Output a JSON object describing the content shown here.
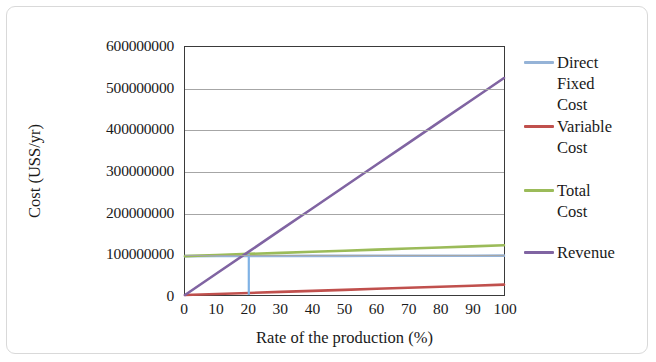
{
  "chart_data": {
    "type": "line",
    "title": "",
    "xlabel": "Rate of the production  (%)",
    "ylabel": "Cost (USS/yr)",
    "xlim": [
      0,
      100
    ],
    "ylim": [
      0,
      600000000
    ],
    "xticks": [
      "0",
      "10",
      "20",
      "30",
      "40",
      "50",
      "60",
      "70",
      "80",
      "90",
      "100"
    ],
    "yticks": [
      "0",
      "100000000",
      "200000000",
      "300000000",
      "400000000",
      "500000000",
      "600000000"
    ],
    "grid": "horizontal",
    "legend_position": "right",
    "x": [
      0,
      10,
      20,
      30,
      40,
      50,
      60,
      70,
      80,
      90,
      100
    ],
    "series": [
      {
        "name": "Direct Fixed Cost",
        "color": "#95B3D7",
        "values": [
          94000000,
          94200000,
          94400000,
          94500000,
          94600000,
          94700000,
          94800000,
          94900000,
          95000000,
          95100000,
          95200000
        ]
      },
      {
        "name": "Variable Cost",
        "color": "#C0504D",
        "values": [
          0,
          2500000,
          5000000,
          7500000,
          10000000,
          12500000,
          15000000,
          17500000,
          20000000,
          22500000,
          25000000
        ]
      },
      {
        "name": "Total Cost",
        "color": "#9BBB59",
        "values": [
          94000000,
          96700000,
          99400000,
          102000000,
          104600000,
          107200000,
          109800000,
          112400000,
          115000000,
          117600000,
          120200000
        ]
      },
      {
        "name": "Revenue",
        "color": "#8064A2",
        "values": [
          0,
          52500000,
          105000000,
          157500000,
          210000000,
          262500000,
          315000000,
          367500000,
          420000000,
          472500000,
          525000000
        ]
      }
    ],
    "annotations": [
      {
        "name": "break-even-dropline",
        "type": "vertical-line",
        "x": 20,
        "y_from": 0,
        "y_to": 99400000,
        "color": "#7FB2E5"
      }
    ],
    "legend_entries": [
      {
        "label_lines": [
          "Direct",
          "Fixed",
          "Cost"
        ],
        "color": "#95B3D7",
        "top": 8
      },
      {
        "label_lines": [
          "Variable",
          "Cost"
        ],
        "color": "#C0504D",
        "top": 72
      },
      {
        "label_lines": [
          "Total",
          "Cost"
        ],
        "color": "#9BBB59",
        "top": 136
      },
      {
        "label_lines": [
          "Revenue"
        ],
        "color": "#8064A2",
        "top": 198
      }
    ]
  }
}
